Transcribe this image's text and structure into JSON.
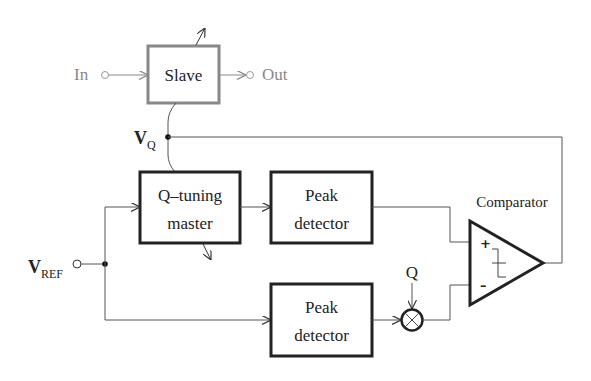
{
  "diagram": {
    "type": "block-diagram",
    "blocks": {
      "slave": {
        "label": "Slave"
      },
      "q_tuning_master": {
        "line1": "Q–tuning",
        "line2": "master"
      },
      "peak_detector_top": {
        "line1": "Peak",
        "line2": "detector"
      },
      "peak_detector_bottom": {
        "line1": "Peak",
        "line2": "detector"
      },
      "comparator": {
        "label": "Comparator",
        "plus": "+",
        "minus": "–"
      }
    },
    "terminals": {
      "in": "In",
      "out": "Out",
      "vref_main": "V",
      "vref_sub": "REF",
      "vq_main": "V",
      "vq_sub": "Q",
      "q_input": "Q"
    },
    "colors": {
      "line": "#555555",
      "block_border": "#222222",
      "slave_border": "#888888",
      "text": "#222222",
      "faded_text": "#888888"
    }
  }
}
